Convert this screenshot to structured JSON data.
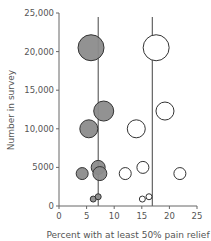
{
  "chart_data": {
    "type": "scatter",
    "subtype": "bubble",
    "title": "",
    "xlabel": "Percent with at least 50% pain relief",
    "ylabel": "Number in survey",
    "xlim": [
      0,
      25
    ],
    "ylim": [
      0,
      25000
    ],
    "x_ticks": [
      0,
      5,
      10,
      15,
      20,
      25
    ],
    "x_tick_labels": [
      "0",
      "5",
      "10",
      "15",
      "20",
      "25"
    ],
    "y_ticks": [
      0,
      5000,
      10000,
      15000,
      20000,
      25000
    ],
    "y_tick_labels": [
      "0",
      "5000",
      "10,000",
      "15,000",
      "20,000",
      "25,000"
    ],
    "grid": false,
    "legend": null,
    "reference_lines": [
      {
        "orientation": "vertical",
        "x": 7.1,
        "series": "filled"
      },
      {
        "orientation": "vertical",
        "x": 16.9,
        "series": "open"
      }
    ],
    "series": [
      {
        "name": "filled",
        "fill": "#8c8c8c",
        "stroke": "#333333",
        "points": [
          {
            "x": 5.8,
            "y": 20500,
            "r": 13
          },
          {
            "x": 8.1,
            "y": 12300,
            "r": 10
          },
          {
            "x": 5.4,
            "y": 10000,
            "r": 9
          },
          {
            "x": 7.1,
            "y": 5000,
            "r": 7
          },
          {
            "x": 7.4,
            "y": 4200,
            "r": 7
          },
          {
            "x": 4.2,
            "y": 4200,
            "r": 6
          },
          {
            "x": 6.2,
            "y": 900,
            "r": 3
          },
          {
            "x": 7.1,
            "y": 1200,
            "r": 3
          }
        ]
      },
      {
        "name": "open",
        "fill": "#ffffff",
        "stroke": "#333333",
        "points": [
          {
            "x": 17.6,
            "y": 20500,
            "r": 13
          },
          {
            "x": 19.2,
            "y": 12300,
            "r": 9
          },
          {
            "x": 14.0,
            "y": 10000,
            "r": 9
          },
          {
            "x": 15.2,
            "y": 5000,
            "r": 6
          },
          {
            "x": 12.0,
            "y": 4200,
            "r": 6
          },
          {
            "x": 21.9,
            "y": 4200,
            "r": 6
          },
          {
            "x": 15.1,
            "y": 900,
            "r": 3
          },
          {
            "x": 16.3,
            "y": 1200,
            "r": 3
          }
        ]
      }
    ]
  }
}
